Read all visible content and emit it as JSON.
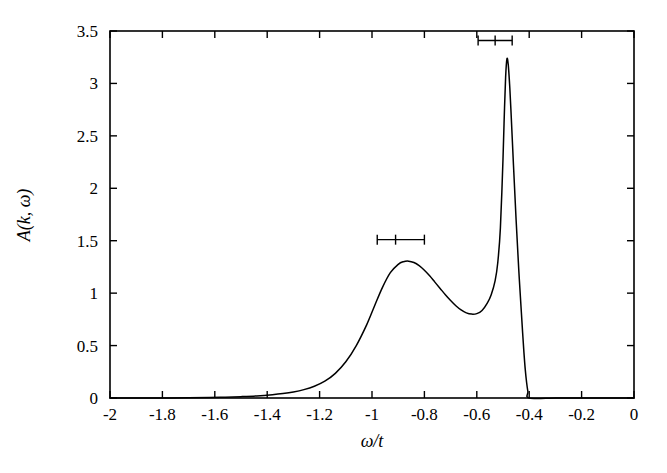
{
  "chart_data": {
    "type": "line",
    "title": "",
    "subtitle": "",
    "xlabel": "ω/t",
    "ylabel": "A(k, ω)",
    "xlim": [
      -2,
      0
    ],
    "ylim": [
      0,
      3.5
    ],
    "grid": false,
    "legend": null,
    "xticks": [
      -2,
      -1.8,
      -1.6,
      -1.4,
      -1.2,
      -1,
      -0.8,
      -0.6,
      -0.4,
      -0.2,
      0
    ],
    "xticklabels": [
      "-2",
      "-1.8",
      "-1.6",
      "-1.4",
      "-1.2",
      "-1",
      "-0.8",
      "-0.6",
      "-0.4",
      "-0.2",
      "0"
    ],
    "yticks": [
      0,
      0.5,
      1,
      1.5,
      2,
      2.5,
      3,
      3.5
    ],
    "yticklabels": [
      "0",
      "0.5",
      "1",
      "1.5",
      "2",
      "2.5",
      "3",
      "3.5"
    ],
    "series": [
      {
        "name": "A(k,omega)",
        "x": [
          -2.0,
          -1.9,
          -1.8,
          -1.7,
          -1.62,
          -1.56,
          -1.5,
          -1.44,
          -1.38,
          -1.34,
          -1.3,
          -1.26,
          -1.22,
          -1.18,
          -1.14,
          -1.1,
          -1.06,
          -1.02,
          -0.99,
          -0.96,
          -0.93,
          -0.9,
          -0.88,
          -0.86,
          -0.84,
          -0.82,
          -0.8,
          -0.78,
          -0.76,
          -0.74,
          -0.72,
          -0.7,
          -0.68,
          -0.66,
          -0.64,
          -0.62,
          -0.6,
          -0.58,
          -0.56,
          -0.545,
          -0.53,
          -0.52,
          -0.51,
          -0.5,
          -0.495,
          -0.49,
          -0.485,
          -0.48,
          -0.475,
          -0.47,
          -0.46,
          -0.45,
          -0.44,
          -0.43,
          -0.425,
          -0.42,
          -0.415,
          -0.41,
          -0.405,
          -0.4,
          -0.3,
          -0.2,
          -0.1,
          0.0
        ],
        "y": [
          0.0,
          0.0,
          0.0,
          0.002,
          0.005,
          0.008,
          0.013,
          0.02,
          0.032,
          0.043,
          0.058,
          0.08,
          0.112,
          0.16,
          0.235,
          0.345,
          0.5,
          0.7,
          0.88,
          1.055,
          1.195,
          1.275,
          1.3,
          1.305,
          1.292,
          1.262,
          1.218,
          1.165,
          1.105,
          1.045,
          0.985,
          0.93,
          0.88,
          0.84,
          0.812,
          0.8,
          0.805,
          0.835,
          0.905,
          0.985,
          1.12,
          1.29,
          1.62,
          2.28,
          2.7,
          3.06,
          3.235,
          3.18,
          3.0,
          2.76,
          2.22,
          1.7,
          1.23,
          0.82,
          0.62,
          0.43,
          0.27,
          0.15,
          0.06,
          0.0,
          0.0,
          0.0,
          0.0,
          0.0
        ]
      }
    ],
    "annotations": [
      {
        "kind": "horizontal-error-bar",
        "name": "error-bar-broad-peak",
        "x": -0.91,
        "y": 1.51,
        "x_low": -0.98,
        "x_high": -0.8,
        "half_width": 0.09
      },
      {
        "kind": "horizontal-error-bar",
        "name": "error-bar-quasiparticle-peak",
        "x": -0.53,
        "y": 3.41,
        "x_low": -0.595,
        "x_high": -0.465,
        "half_width": 0.065
      }
    ],
    "features": {
      "broad_peak_position": -0.87,
      "broad_peak_height": 1.3,
      "local_minimum_position": -0.65,
      "local_minimum_height": 0.8,
      "sharp_peak_position": -0.485,
      "sharp_peak_height": 3.24,
      "cutoff_position": -0.4
    }
  }
}
